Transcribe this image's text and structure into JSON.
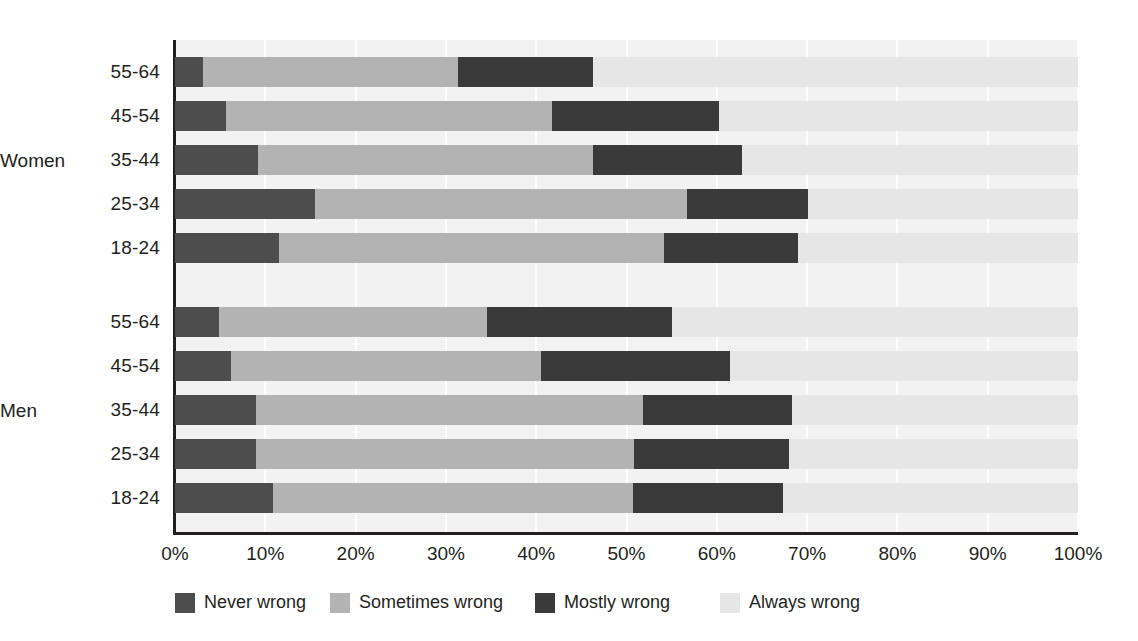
{
  "chart_data": {
    "type": "bar",
    "subtype": "stacked-horizontal-100pct",
    "title": "",
    "xlabel": "",
    "ylabel": "",
    "xlim": [
      0,
      100
    ],
    "grid": true,
    "legend_position": "bottom",
    "series": [
      {
        "name": "Never wrong",
        "key": "never",
        "color": "#4d4d4d"
      },
      {
        "name": "Sometimes wrong",
        "key": "sometimes",
        "color": "#b3b3b3"
      },
      {
        "name": "Mostly wrong",
        "key": "mostly",
        "color": "#3a3a3a"
      },
      {
        "name": "Always wrong",
        "key": "always",
        "color": "#e6e6e6"
      }
    ],
    "xticks": [
      {
        "value": 0,
        "label": "0%"
      },
      {
        "value": 10,
        "label": "10%"
      },
      {
        "value": 20,
        "label": "20%"
      },
      {
        "value": 30,
        "label": "30%"
      },
      {
        "value": 40,
        "label": "40%"
      },
      {
        "value": 50,
        "label": "50%"
      },
      {
        "value": 60,
        "label": "60%"
      },
      {
        "value": 70,
        "label": "70%"
      },
      {
        "value": 80,
        "label": "80%"
      },
      {
        "value": 90,
        "label": "90%"
      },
      {
        "value": 100,
        "label": "100%"
      }
    ],
    "groups": [
      {
        "name": "Women",
        "rows": [
          {
            "category": "55-64",
            "values": [
              3.1,
              28.2,
              15.0,
              53.7
            ]
          },
          {
            "category": "45-54",
            "values": [
              5.6,
              36.1,
              18.5,
              39.8
            ]
          },
          {
            "category": "35-44",
            "values": [
              9.2,
              37.1,
              16.5,
              37.2
            ]
          },
          {
            "category": "25-34",
            "values": [
              15.5,
              41.2,
              13.4,
              29.9
            ]
          },
          {
            "category": "18-24",
            "values": [
              11.5,
              42.6,
              14.9,
              31.0
            ]
          }
        ]
      },
      {
        "name": "Men",
        "rows": [
          {
            "category": "55-64",
            "values": [
              4.9,
              29.6,
              20.5,
              45.0
            ]
          },
          {
            "category": "45-54",
            "values": [
              6.2,
              34.3,
              21.0,
              38.5
            ]
          },
          {
            "category": "35-44",
            "values": [
              9.0,
              42.8,
              16.5,
              31.7
            ]
          },
          {
            "category": "25-34",
            "values": [
              9.0,
              41.8,
              17.2,
              32.0
            ]
          },
          {
            "category": "18-24",
            "values": [
              10.8,
              39.9,
              16.6,
              32.7
            ]
          }
        ]
      }
    ]
  },
  "legend": {
    "items": [
      {
        "label": "Never wrong",
        "key": "never"
      },
      {
        "label": "Sometimes wrong",
        "key": "sometimes"
      },
      {
        "label": "Mostly wrong",
        "key": "mostly"
      },
      {
        "label": "Always wrong",
        "key": "always"
      }
    ]
  }
}
